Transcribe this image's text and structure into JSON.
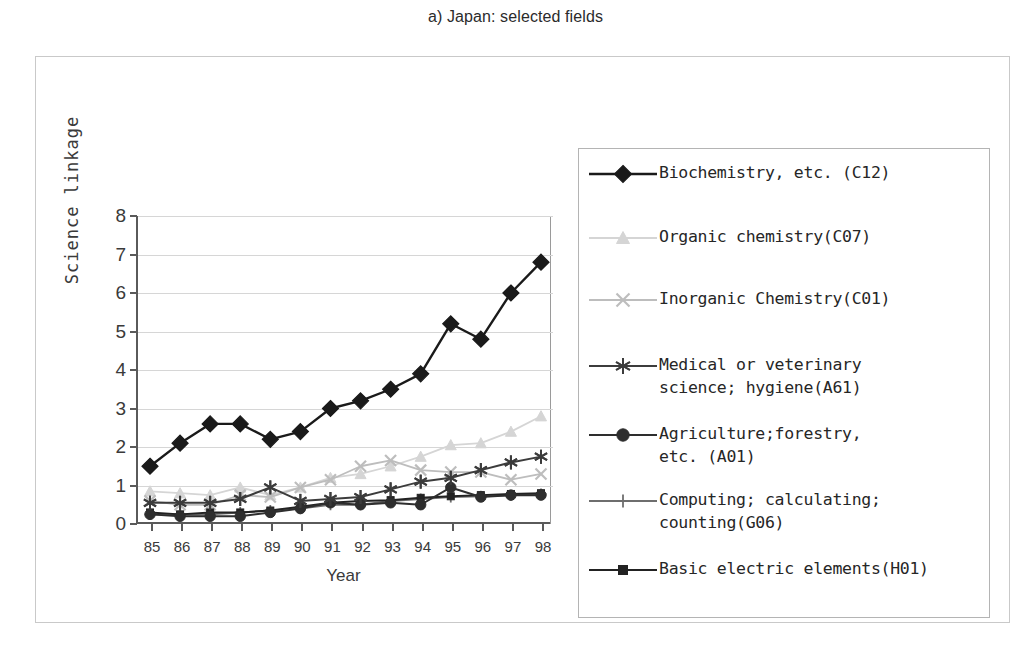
{
  "title": "a) Japan: selected fields",
  "axes": {
    "xlabel": "Year",
    "ylabel": "Science linkage",
    "yticks": [
      "8",
      "7",
      "6",
      "5",
      "4",
      "3",
      "2",
      "1",
      "0"
    ],
    "xticks": [
      "85",
      "86",
      "87",
      "88",
      "89",
      "90",
      "91",
      "92",
      "93",
      "94",
      "95",
      "96",
      "97",
      "98"
    ]
  },
  "legend": {
    "items": [
      {
        "label": "Biochemistry, etc. (C12)",
        "marker": "diamond",
        "color": "#1a1a1a"
      },
      {
        "label": "Organic chemistry(C07)",
        "marker": "triangle",
        "color": "#d5d5d5"
      },
      {
        "label": "Inorganic Chemistry(C01)",
        "marker": "cross-x",
        "color": "#bdbdbd"
      },
      {
        "label": "Medical or veterinary\nscience; hygiene(A61)",
        "marker": "asterisk",
        "color": "#3c3c3c"
      },
      {
        "label": "Agriculture;forestry,\netc. (A01)",
        "marker": "circle",
        "color": "#2e2e2e"
      },
      {
        "label": "Computing; calculating;\ncounting(G06)",
        "marker": "plus",
        "color": "#6e6e6e"
      },
      {
        "label": "Basic electric elements(H01)",
        "marker": "square-small",
        "color": "#222222"
      }
    ]
  },
  "chart_data": {
    "type": "line",
    "title": "a) Japan: selected fields",
    "xlabel": "Year",
    "ylabel": "Science linkage",
    "x": [
      "85",
      "86",
      "87",
      "88",
      "89",
      "90",
      "91",
      "92",
      "93",
      "94",
      "95",
      "96",
      "97",
      "98"
    ],
    "ylim": [
      0,
      8
    ],
    "xlim": [
      "85",
      "98"
    ],
    "grid": true,
    "legend_position": "right",
    "series": [
      {
        "name": "Biochemistry, etc. (C12)",
        "marker": "diamond",
        "color": "#1a1a1a",
        "values": [
          1.5,
          2.1,
          2.6,
          2.6,
          2.2,
          2.4,
          3.0,
          3.2,
          3.5,
          3.9,
          5.2,
          4.8,
          6.0,
          6.8
        ]
      },
      {
        "name": "Organic chemistry(C07)",
        "marker": "triangle",
        "color": "#d5d5d5",
        "values": [
          0.85,
          0.8,
          0.75,
          0.95,
          0.75,
          0.95,
          1.2,
          1.3,
          1.5,
          1.75,
          2.05,
          2.1,
          2.4,
          2.8
        ]
      },
      {
        "name": "Inorganic Chemistry(C01)",
        "marker": "cross-x",
        "color": "#bdbdbd",
        "values": [
          0.6,
          0.5,
          0.5,
          0.75,
          0.7,
          0.95,
          1.15,
          1.5,
          1.65,
          1.4,
          1.35,
          1.35,
          1.15,
          1.3
        ]
      },
      {
        "name": "Medical or veterinary science; hygiene(A61)",
        "marker": "asterisk",
        "color": "#3c3c3c",
        "values": [
          0.55,
          0.55,
          0.55,
          0.65,
          0.95,
          0.6,
          0.65,
          0.7,
          0.9,
          1.1,
          1.2,
          1.4,
          1.6,
          1.75
        ]
      },
      {
        "name": "Agriculture;forestry, etc. (A01)",
        "marker": "circle",
        "color": "#2e2e2e",
        "values": [
          0.25,
          0.2,
          0.2,
          0.2,
          0.3,
          0.4,
          0.55,
          0.5,
          0.55,
          0.5,
          0.95,
          0.7,
          0.75,
          0.75
        ]
      },
      {
        "name": "Computing; calculating; counting(G06)",
        "marker": "plus",
        "color": "#6e6e6e",
        "values": [
          0.25,
          0.25,
          0.25,
          0.3,
          0.35,
          0.4,
          0.5,
          0.5,
          0.6,
          0.65,
          0.7,
          0.72,
          0.75,
          0.78
        ]
      },
      {
        "name": "Basic electric elements(H01)",
        "marker": "square-small",
        "color": "#222222",
        "values": [
          0.3,
          0.25,
          0.3,
          0.3,
          0.35,
          0.45,
          0.55,
          0.6,
          0.62,
          0.68,
          0.72,
          0.75,
          0.78,
          0.8
        ]
      }
    ]
  }
}
